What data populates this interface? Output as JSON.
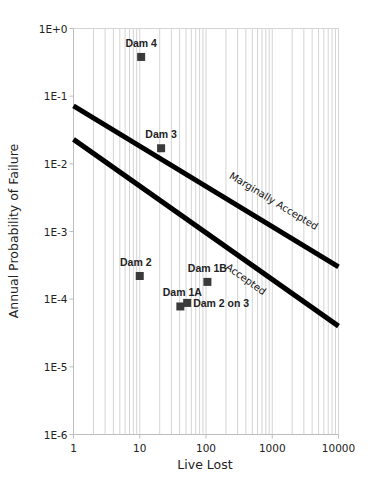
{
  "chart_data": {
    "type": "scatter",
    "title": "",
    "xlabel": "Live Lost",
    "ylabel": "Annual Probability of Failure",
    "xscale": "log",
    "yscale": "log",
    "xlim": [
      1,
      10000
    ],
    "ylim": [
      1e-06,
      1
    ],
    "x_ticks": [
      1,
      10,
      100,
      1000,
      10000
    ],
    "x_tick_labels": [
      "1",
      "10",
      "100",
      "1000",
      "10000"
    ],
    "y_ticks": [
      1,
      0.1,
      0.01,
      0.001,
      0.0001,
      1e-05,
      1e-06
    ],
    "y_tick_labels": [
      "1E+0",
      "1E-1",
      "1E-2",
      "1E-3",
      "1E-4",
      "1E-5",
      "1E-6"
    ],
    "grid": "vertical minor gridlines only",
    "legend": "none",
    "points": [
      {
        "label": "Dam 4",
        "x": 10.5,
        "y": 0.38
      },
      {
        "label": "Dam 3",
        "x": 21,
        "y": 0.017
      },
      {
        "label": "Dam 2",
        "x": 10,
        "y": 0.00022
      },
      {
        "label": "Dam 1B",
        "x": 105,
        "y": 0.00018
      },
      {
        "label": "Dam 1A",
        "x": 41,
        "y": 7.8e-05
      },
      {
        "label": "Dam 2 on 3",
        "x": 52,
        "y": 8.8e-05
      }
    ],
    "lines": [
      {
        "label": "Marginally Accepted",
        "x": [
          1,
          10000
        ],
        "y": [
          0.072,
          0.0003
        ]
      },
      {
        "label": "Accepted",
        "x": [
          1,
          10000
        ],
        "y": [
          0.023,
          4e-05
        ]
      }
    ],
    "colors": {
      "points": "#3a3a3a",
      "lines": "#000000",
      "grid": "#d4d4d4"
    }
  }
}
